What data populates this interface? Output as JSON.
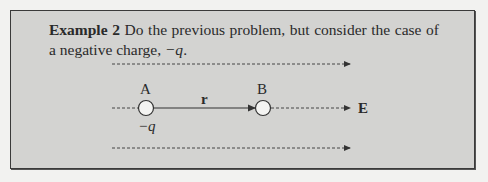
{
  "example": {
    "label": "Example 2",
    "text_before": "Do the previous problem, but consider the case of a negative charge, ",
    "charge_symbol": "−q",
    "text_after": "."
  },
  "diagram": {
    "point_a_label": "A",
    "point_b_label": "B",
    "vector_label": "r",
    "field_label": "E",
    "charge_label": "−q",
    "colors": {
      "box_background": "#d3d3d1",
      "border": "#3a3a3a",
      "line": "#333333",
      "circle_fill": "#f4f4f2"
    }
  }
}
